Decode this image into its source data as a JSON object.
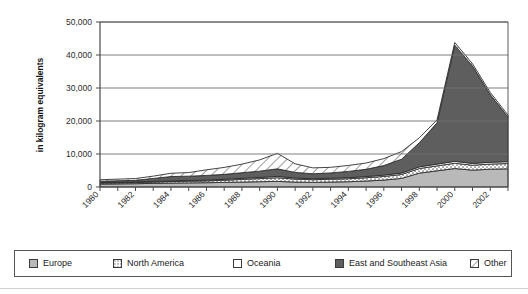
{
  "chart_data": {
    "type": "area",
    "stacked": true,
    "title": "",
    "xlabel": "",
    "ylabel": "in kilogram equivalents",
    "xlim": [
      1980,
      2003
    ],
    "ylim": [
      0,
      50000
    ],
    "grid": true,
    "legend_position": "bottom",
    "y_ticks": [
      0,
      10000,
      20000,
      30000,
      40000,
      50000
    ],
    "y_tick_labels": [
      "0",
      "10,000",
      "20,000",
      "30,000",
      "40,000",
      "50,000"
    ],
    "x": [
      1980,
      1981,
      1982,
      1983,
      1984,
      1985,
      1986,
      1987,
      1988,
      1989,
      1990,
      1991,
      1992,
      1993,
      1994,
      1995,
      1996,
      1997,
      1998,
      1999,
      2000,
      2001,
      2002,
      2003
    ],
    "x_tick_labels": [
      "1980",
      "1982",
      "1984",
      "1986",
      "1988",
      "1990",
      "1992",
      "1994",
      "1996",
      "1998",
      "2000",
      "2002"
    ],
    "x_tick_values": [
      1980,
      1982,
      1984,
      1986,
      1988,
      1990,
      1992,
      1994,
      1996,
      1998,
      2000,
      2002
    ],
    "series": [
      {
        "name": "Europe",
        "fill": "#b9b9b9",
        "pattern": "solid-light-gray",
        "values": [
          900,
          950,
          1000,
          1100,
          1200,
          1250,
          1300,
          1400,
          1500,
          1600,
          1700,
          1500,
          1400,
          1500,
          1600,
          1800,
          2100,
          2600,
          4200,
          4900,
          5600,
          5100,
          5400,
          5500
        ]
      },
      {
        "name": "North America",
        "fill": "#e8e8e8",
        "pattern": "dots",
        "values": [
          300,
          320,
          350,
          400,
          450,
          500,
          550,
          650,
          800,
          950,
          1100,
          900,
          800,
          850,
          900,
          1000,
          1100,
          1200,
          1400,
          1500,
          1600,
          1500,
          1550,
          1600
        ]
      },
      {
        "name": "Oceania",
        "fill": "#ffffff",
        "pattern": "solid-white",
        "values": [
          150,
          160,
          170,
          190,
          210,
          230,
          250,
          280,
          320,
          360,
          400,
          330,
          300,
          310,
          330,
          360,
          400,
          430,
          500,
          540,
          580,
          540,
          560,
          580
        ]
      },
      {
        "name": "East and Southeast Asia",
        "fill": "#5e5e5e",
        "pattern": "solid-dark-gray",
        "values": [
          400,
          450,
          500,
          900,
          1300,
          1300,
          1400,
          1500,
          1700,
          1900,
          2300,
          1700,
          1500,
          1600,
          1900,
          2200,
          2900,
          4200,
          7300,
          12500,
          35200,
          29500,
          20500,
          13500
        ]
      },
      {
        "name": "Other",
        "fill": "#ffffff",
        "pattern": "diagonal-hatch",
        "values": [
          450,
          500,
          550,
          700,
          1000,
          1100,
          1700,
          2100,
          2600,
          3400,
          4700,
          2600,
          1800,
          1700,
          1800,
          1900,
          2100,
          2300,
          1500,
          900,
          800,
          700,
          650,
          600
        ]
      }
    ],
    "peak": {
      "year": 2000,
      "total": 43500
    },
    "secondary_peak": {
      "year": 1990,
      "total": 10200
    },
    "end_value": {
      "year": 2003,
      "total": 21780
    }
  },
  "legend": {
    "items": [
      {
        "label": "Europe",
        "swatch": "solid-light-gray"
      },
      {
        "label": "North America",
        "swatch": "dots"
      },
      {
        "label": "Oceania",
        "swatch": "solid-white"
      },
      {
        "label": "East and Southeast Asia",
        "swatch": "solid-dark-gray"
      },
      {
        "label": "Other",
        "swatch": "diagonal-hatch"
      }
    ]
  },
  "colors": {
    "europe": "#b9b9b9",
    "north_america": "#e8e8e8",
    "oceania": "#ffffff",
    "east_southeast_asia": "#5e5e5e",
    "other": "#ffffff",
    "axis": "#4a4a4a",
    "grid": "#6f6f6f",
    "text": "#1a1a1a"
  }
}
